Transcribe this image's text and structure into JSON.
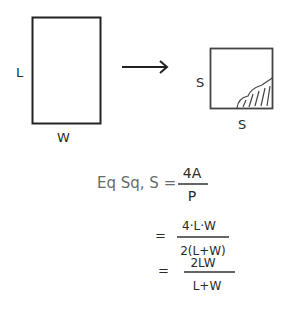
{
  "diagram": {
    "rectangle": {
      "side_label": "L",
      "bottom_label": "W"
    },
    "arrow": {
      "direction": "right"
    },
    "square": {
      "side_label": "S",
      "bottom_label": "S",
      "shaded_corner": "bottom-right"
    }
  },
  "equation": {
    "lhs": "Eq Sq, S =",
    "lines": [
      {
        "prefix": "",
        "numerator": "4A",
        "denominator": "P"
      },
      {
        "prefix": "=",
        "numerator": "4·L·W",
        "denominator": "2(L+W)"
      },
      {
        "prefix": "=",
        "numerator": "2LW",
        "denominator": "L+W"
      }
    ]
  }
}
